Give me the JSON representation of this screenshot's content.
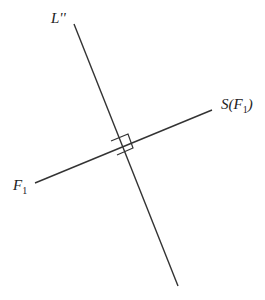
{
  "diagram": {
    "labels": {
      "line_l": "L''",
      "s_f1_pre": "S(",
      "s_f1_var": "F",
      "s_f1_sub": "1",
      "s_f1_post": ")",
      "f1_var": "F",
      "f1_sub": "1"
    },
    "colors": {
      "line": "#333333",
      "background": "#ffffff"
    }
  }
}
